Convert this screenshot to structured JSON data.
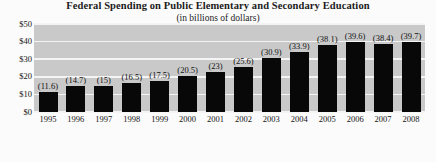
{
  "chart_data": {
    "type": "bar",
    "title": "Federal Spending on Public Elementary and Secondary Education",
    "subtitle": "(in billions of dollars)",
    "xlabel": "",
    "ylabel": "",
    "ylim": [
      0,
      50
    ],
    "yticks": [
      "$0",
      "$10",
      "$20",
      "$30",
      "$40",
      "$50"
    ],
    "ytick_values": [
      0,
      10,
      20,
      30,
      40,
      50
    ],
    "grid": true,
    "legend": "none",
    "categories": [
      "1995",
      "1996",
      "1997",
      "1998",
      "1999",
      "2000",
      "2001",
      "2002",
      "2003",
      "2004",
      "2005",
      "2006",
      "2007",
      "2008"
    ],
    "values": [
      11.6,
      14.7,
      15,
      16.5,
      17.5,
      20.5,
      23,
      25.6,
      30.9,
      33.9,
      38.1,
      39.6,
      38.4,
      39.7
    ],
    "value_labels": [
      "(11.6)",
      "(14.7)",
      "(15)",
      "(16.5)",
      "(17.5)",
      "(20.5)",
      "(23)",
      "(25.6)",
      "(30.9)",
      "(33.9)",
      "(38.1)",
      "(39.6)",
      "(38.4)",
      "(39.7)"
    ],
    "colors": {
      "bar": "#080808",
      "plot_background": "#c9c9c9",
      "gridline": "#f4f4f4",
      "page_background": "#fbfbfb",
      "text": "#141414"
    }
  },
  "source_note": ""
}
